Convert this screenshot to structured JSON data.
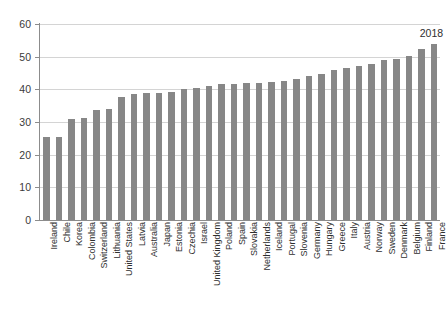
{
  "chart_data": {
    "type": "bar",
    "title": "",
    "subtitle": "",
    "xlabel": "",
    "ylabel": "",
    "ylim": [
      0,
      60
    ],
    "yticks": [
      0,
      10,
      20,
      30,
      40,
      50,
      60
    ],
    "grid": true,
    "legend": false,
    "legend_position": "none",
    "bar_color": "#878787",
    "annotations": [
      {
        "text": "2018",
        "near_category": "France",
        "position": "above-last-bar"
      }
    ],
    "categories": [
      "Ireland",
      "Chile",
      "Korea",
      "Colombia",
      "Switzerland",
      "Lithuania",
      "United States",
      "Latvia",
      "Australia",
      "Japan",
      "Estonia",
      "Czechia",
      "Israel",
      "United Kingdom",
      "Poland",
      "Spain",
      "Slovakia",
      "Netherlands",
      "Iceland",
      "Portugal",
      "Slovenia",
      "Germany",
      "Hungary",
      "Greece",
      "Italy",
      "Austria",
      "Norway",
      "Sweden",
      "Denmark",
      "Belgium",
      "Finland",
      "France"
    ],
    "values": [
      25.3,
      25.5,
      31.0,
      31.1,
      33.6,
      33.9,
      37.8,
      38.6,
      38.9,
      39.0,
      39.3,
      40.0,
      40.4,
      41.0,
      41.5,
      41.7,
      41.9,
      42.0,
      42.2,
      42.6,
      43.1,
      44.1,
      44.6,
      45.8,
      46.6,
      47.3,
      47.7,
      48.9,
      49.3,
      50.1,
      52.4,
      53.9
    ]
  }
}
